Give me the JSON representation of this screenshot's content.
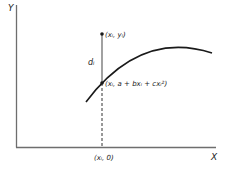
{
  "diagram": {
    "axes": {
      "y_label": "Y",
      "x_label": "X"
    },
    "observed_point": {
      "label": "(xᵢ, yᵢ)"
    },
    "fitted_point": {
      "label": "(xᵢ, a + bxᵢ + cxᵢ²)"
    },
    "deviation": {
      "label": "dᵢ"
    },
    "x_intercept": {
      "label": "(xᵢ, 0)"
    },
    "curve": {
      "type": "quadratic",
      "description": "a + bx + cx²"
    },
    "colors": {
      "axis": "#6e6e6e",
      "curve": "#1a1a1a",
      "text": "#222222"
    }
  }
}
